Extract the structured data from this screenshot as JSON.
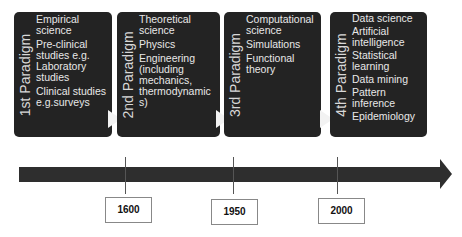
{
  "paradigms": [
    {
      "label": "1st Paradigm",
      "items": [
        "Empirical science",
        "Pre-clinical studies e.g. Laboratory studies",
        "Clinical studies e.g.surveys"
      ]
    },
    {
      "label": "2nd Paradigm",
      "items": [
        "Theoretical science",
        "Physics",
        "Engineering (including mechanics, thermodynamic s)"
      ]
    },
    {
      "label": "3rd Paradigm",
      "items": [
        "Computational science",
        "Simulations",
        "Functional theory"
      ]
    },
    {
      "label": "4th Paradigm",
      "items": [
        "Data science",
        "Artificial intelligence",
        "Statistical learning",
        "Data mining",
        "Pattern inference",
        "Epidemiology"
      ]
    }
  ],
  "timeline": {
    "years": [
      "1600",
      "1950",
      "2000"
    ],
    "colors": {
      "box": "#232323",
      "arrow": "#2e2e2e"
    }
  }
}
